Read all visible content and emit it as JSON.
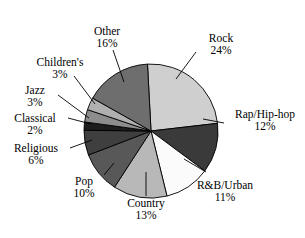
{
  "chart_data": {
    "type": "pie",
    "title": "",
    "subtitle": "",
    "xlabel": "",
    "ylabel": "",
    "legend_position": "none",
    "grid": false,
    "labels_show_percent": true,
    "start_angle_deg": -93,
    "direction": "clockwise",
    "categories": [
      "Rock",
      "Rap/Hip-hop",
      "R&B/Urban",
      "Country",
      "Pop",
      "Religious",
      "Classical",
      "Jazz",
      "Children's",
      "Other"
    ],
    "values": [
      24,
      12,
      11,
      13,
      10,
      6,
      2,
      3,
      3,
      16
    ],
    "units": "percent",
    "total": 100,
    "slices": [
      {
        "label": "Rock",
        "percent": 24,
        "percent_text": "24%",
        "color": "#cfcfcf"
      },
      {
        "label": "Rap/Hip-hop",
        "percent": 12,
        "percent_text": "12%",
        "color": "#3a3a3a"
      },
      {
        "label": "R&B/Urban",
        "percent": 11,
        "percent_text": "11%",
        "color": "#fbfbfb"
      },
      {
        "label": "Country",
        "percent": 13,
        "percent_text": "13%",
        "color": "#b8b8b8"
      },
      {
        "label": "Pop",
        "percent": 10,
        "percent_text": "10%",
        "color": "#585858"
      },
      {
        "label": "Religious",
        "percent": 6,
        "percent_text": "6%",
        "color": "#3f3f3f"
      },
      {
        "label": "Classical",
        "percent": 2,
        "percent_text": "2%",
        "color": "#1d1d1d"
      },
      {
        "label": "Jazz",
        "percent": 3,
        "percent_text": "3%",
        "color": "#8d8d8d"
      },
      {
        "label": "Children's",
        "percent": 3,
        "percent_text": "3%",
        "color": "#b0b0b0"
      },
      {
        "label": "Other",
        "percent": 16,
        "percent_text": "16%",
        "color": "#6e6e6e"
      }
    ],
    "colors": {
      "outline": "#000000",
      "background": "#ffffff",
      "text": "#000000",
      "leader_line": "#000000"
    }
  },
  "labels": {
    "rock": {
      "name": "Rock",
      "percent": "24%"
    },
    "rap": {
      "name": "Rap/Hip-hop",
      "percent": "12%"
    },
    "rnb": {
      "name": "R&B/Urban",
      "percent": "11%"
    },
    "country": {
      "name": "Country",
      "percent": "13%"
    },
    "pop": {
      "name": "Pop",
      "percent": "10%"
    },
    "religious": {
      "name": "Religious",
      "percent": "6%"
    },
    "classical": {
      "name": "Classical",
      "percent": "2%"
    },
    "jazz": {
      "name": "Jazz",
      "percent": "3%"
    },
    "children": {
      "name": "Children's",
      "percent": "3%"
    },
    "other": {
      "name": "Other",
      "percent": "16%"
    }
  }
}
